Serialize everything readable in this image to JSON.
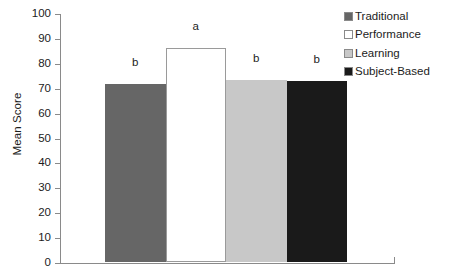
{
  "chart_data": {
    "type": "bar",
    "title": "",
    "subtitle": "",
    "xlabel": "",
    "ylabel": "Mean Score",
    "categories": [
      "Traditional",
      "Performance",
      "Learning",
      "Subject-Based"
    ],
    "values": [
      71.5,
      86,
      73,
      72.5
    ],
    "annotations": [
      "b",
      "a",
      "b",
      "b"
    ],
    "bar_colors": [
      "#666666",
      "#ffffff",
      "#c8c8c8",
      "#1a1a1a"
    ],
    "ylim": [
      0,
      100
    ],
    "yticks": [
      {
        "value": 100,
        "label": "100"
      },
      {
        "value": 90,
        "label": "90"
      },
      {
        "value": 80,
        "label": "80"
      },
      {
        "value": 70,
        "label": "70"
      },
      {
        "value": 60,
        "label": "60"
      },
      {
        "value": 50,
        "label": "50"
      },
      {
        "value": 40,
        "label": "40"
      },
      {
        "value": 30,
        "label": "30"
      },
      {
        "value": 20,
        "label": "20"
      },
      {
        "value": 10,
        "label": "10"
      },
      {
        "value": 0,
        "label": "0"
      }
    ],
    "xticks": [],
    "grid": false,
    "legend_position": "right-top",
    "legend": [
      {
        "label": "Traditional",
        "color": "#666666"
      },
      {
        "label": "Performance",
        "color": "#ffffff"
      },
      {
        "label": "Learning",
        "color": "#c8c8c8"
      },
      {
        "label": "Subject-Based",
        "color": "#1a1a1a"
      }
    ]
  }
}
